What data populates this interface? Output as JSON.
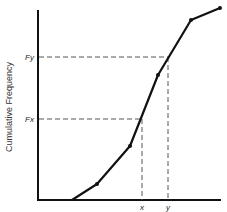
{
  "chart_data": {
    "type": "line",
    "title": "",
    "xlabel": "",
    "ylabel": "Cumulative Frequency",
    "series": [
      {
        "name": "cumulative frequency curve",
        "points_px": [
          [
            72,
            200
          ],
          [
            97,
            184
          ],
          [
            130,
            146
          ],
          [
            158,
            75
          ],
          [
            191,
            20
          ],
          [
            220,
            8
          ]
        ]
      }
    ],
    "annotations": {
      "Fy": {
        "label": "Fy",
        "y_px": 57,
        "x_end_px": 168
      },
      "Fx": {
        "label": "Fx",
        "y_px": 119,
        "x_end_px": 142
      },
      "x": {
        "label": "x",
        "x_px": 142
      },
      "y": {
        "label": "y",
        "x_px": 168
      }
    },
    "grid": false,
    "legend": "none"
  },
  "labels": {
    "ylabel": "Cumulative Frequency",
    "fy": "Fy",
    "fx": "Fx",
    "x": "x",
    "y": "y"
  },
  "colors": {
    "line": "#111111",
    "dash": "#555555"
  }
}
